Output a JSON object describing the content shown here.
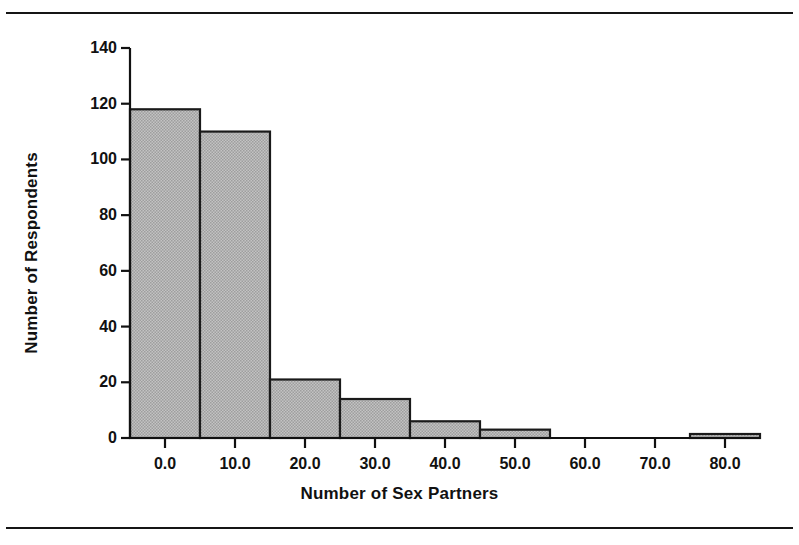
{
  "figure": {
    "background_color": "#ffffff",
    "rule_color": "#151515",
    "axis_color": "#111111",
    "bar_fill_color": "#b9b9b9",
    "bar_edge_color": "#1a1a1a"
  },
  "chart_data": {
    "type": "bar",
    "title": "",
    "subtitle": "",
    "xlabel": "Number of Sex Partners",
    "ylabel": "Number of Respondents",
    "grid": false,
    "legend": false,
    "legend_position": "none",
    "xlim": [
      -5,
      85
    ],
    "ylim": [
      0,
      140
    ],
    "xticks": [
      0,
      10,
      20,
      30,
      40,
      50,
      60,
      70,
      80
    ],
    "xtick_labels": [
      "0.0",
      "10.0",
      "20.0",
      "30.0",
      "40.0",
      "50.0",
      "60.0",
      "70.0",
      "80.0"
    ],
    "yticks": [
      0,
      20,
      40,
      60,
      80,
      100,
      120,
      140
    ],
    "ytick_labels": [
      "0",
      "20",
      "40",
      "60",
      "80",
      "100",
      "120",
      "140"
    ],
    "bin_width": 10,
    "bins": [
      {
        "start": -5,
        "end": 5,
        "center": 0,
        "value": 118
      },
      {
        "start": 5,
        "end": 15,
        "center": 10,
        "value": 110
      },
      {
        "start": 15,
        "end": 25,
        "center": 20,
        "value": 21
      },
      {
        "start": 25,
        "end": 35,
        "center": 30,
        "value": 14
      },
      {
        "start": 35,
        "end": 45,
        "center": 40,
        "value": 6
      },
      {
        "start": 45,
        "end": 55,
        "center": 50,
        "value": 3
      },
      {
        "start": 55,
        "end": 65,
        "center": 60,
        "value": 0
      },
      {
        "start": 65,
        "end": 75,
        "center": 70,
        "value": 0
      },
      {
        "start": 75,
        "end": 85,
        "center": 80,
        "value": 1
      }
    ],
    "categories": [
      "0",
      "10",
      "20",
      "30",
      "40",
      "50",
      "60",
      "70",
      "80"
    ],
    "values": [
      118,
      110,
      21,
      14,
      6,
      3,
      0,
      0,
      1
    ]
  }
}
